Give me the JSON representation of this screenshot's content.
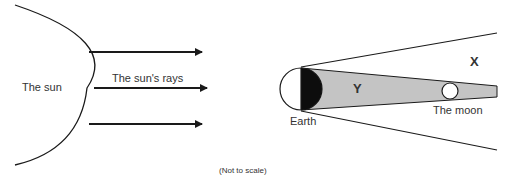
{
  "diagram": {
    "sun": {
      "label": "The sun"
    },
    "rays": {
      "label": "The sun's rays",
      "count": 3
    },
    "earth": {
      "label": "Earth"
    },
    "moon": {
      "label": "The moon"
    },
    "regions": {
      "outer": "X",
      "inner": "Y"
    },
    "note": "(Not to scale)",
    "colors": {
      "line": "#1a1a1a",
      "shadow_fill": "#c4c4c4",
      "night_side": "#0d0d0d",
      "background": "#ffffff"
    }
  }
}
